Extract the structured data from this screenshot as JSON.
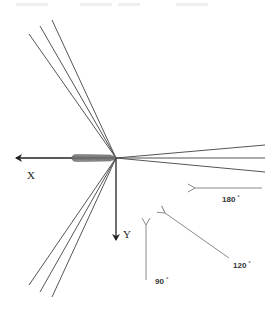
{
  "diagram": {
    "axes": {
      "x_label": "X",
      "y_label": "Y"
    },
    "origin": [
      116,
      158
    ],
    "colors": {
      "axis": "#222222",
      "rays": "#555555",
      "direction_arrows": "#8a8a8a",
      "body": "#777777"
    },
    "ray_groups": [
      {
        "name": "upper-left",
        "endpoints": [
          [
            29,
            34
          ],
          [
            40,
            26
          ],
          [
            52,
            20
          ]
        ]
      },
      {
        "name": "lower-left",
        "endpoints": [
          [
            29,
            285
          ],
          [
            40,
            292
          ],
          [
            52,
            297
          ]
        ]
      },
      {
        "name": "right",
        "endpoints": [
          [
            265,
            145
          ],
          [
            265,
            158
          ],
          [
            265,
            172
          ]
        ]
      }
    ],
    "direction_arrows": [
      {
        "angle_text": "180",
        "unit": "°",
        "from": [
          262,
          188
        ],
        "to": [
          195,
          188
        ],
        "label_pos": [
          222,
          201
        ]
      },
      {
        "angle_text": "120",
        "unit": "°",
        "from": [
          229,
          258
        ],
        "to": [
          165,
          213
        ],
        "label_pos": [
          233,
          267
        ]
      },
      {
        "angle_text": "90",
        "unit": "°",
        "from": [
          146,
          280
        ],
        "to": [
          146,
          225
        ],
        "label_pos": [
          155,
          283
        ]
      }
    ]
  }
}
